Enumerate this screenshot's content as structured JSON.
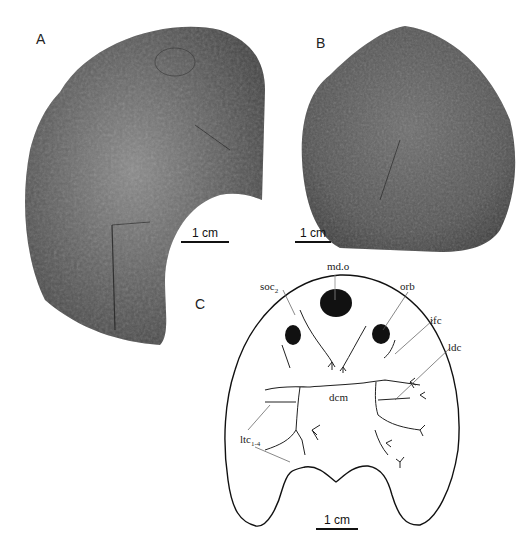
{
  "figure": {
    "panels": [
      {
        "id": "A",
        "label": "A",
        "description": "Fossil specimen photograph, dorsal head shield (partial, posterior notch)",
        "scale_bar": "1 cm"
      },
      {
        "id": "B",
        "label": "B",
        "description": "Fossil specimen photograph, rounded head shield with tuberculate ornament",
        "scale_bar": "1 cm"
      },
      {
        "id": "C",
        "label": "C",
        "description": "Line drawing reconstruction of head shield with sensory canal system",
        "scale_bar": "1 cm",
        "annotations": {
          "md_o": "md.o",
          "soc": "soc",
          "soc_sub": "2",
          "orb": "orb",
          "ifc": "ifc",
          "ldc": "ldc",
          "dcm": "dcm",
          "ltc": "ltc",
          "ltc_sub": "1-4"
        }
      }
    ]
  }
}
